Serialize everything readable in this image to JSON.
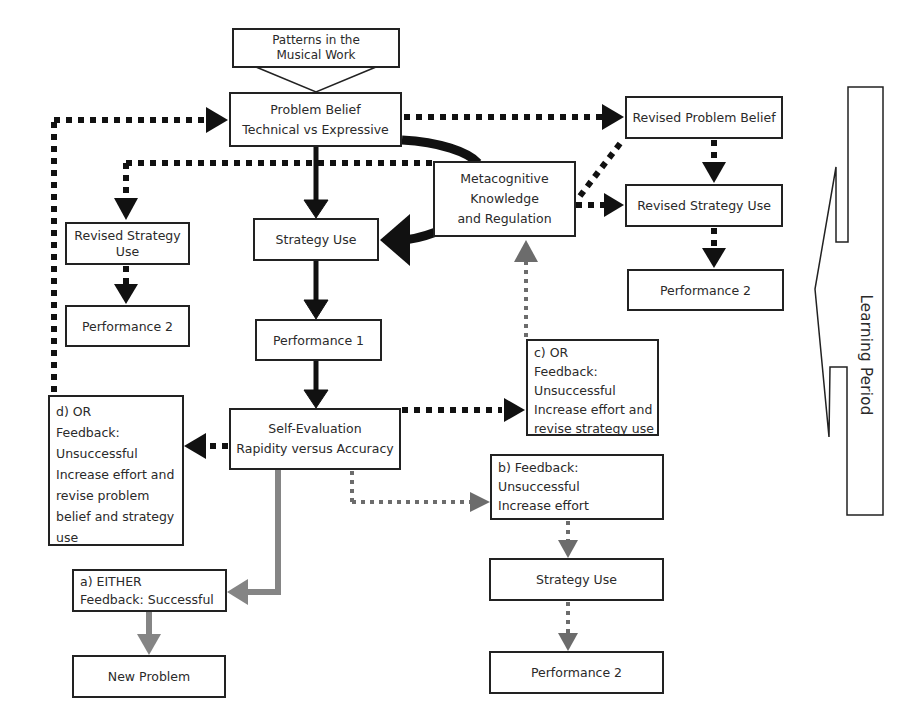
{
  "diagram": {
    "type": "flowchart",
    "nodes": {
      "patterns": {
        "lines": [
          "Patterns in the",
          "Musical Work"
        ]
      },
      "problem_belief": {
        "lines": [
          "Problem Belief",
          "Technical vs Expressive"
        ]
      },
      "metacognitive": {
        "lines": [
          "Metacognitive",
          "Knowledge",
          "and Regulation"
        ]
      },
      "revised_problem_belief": {
        "lines": [
          "Revised Problem Belief"
        ]
      },
      "revised_strategy_use_right": {
        "lines": [
          "Revised Strategy Use"
        ]
      },
      "performance2_right": {
        "lines": [
          "Performance 2"
        ]
      },
      "revised_strategy_use_left": {
        "lines": [
          "Revised Strategy",
          "Use"
        ]
      },
      "performance2_left": {
        "lines": [
          "Performance 2"
        ]
      },
      "strategy_use": {
        "lines": [
          "Strategy Use"
        ]
      },
      "performance1": {
        "lines": [
          "Performance 1"
        ]
      },
      "self_evaluation": {
        "lines": [
          "Self-Evaluation",
          "Rapidity versus Accuracy"
        ]
      },
      "feedback_d": {
        "lines": [
          "d) OR",
          "Feedback:",
          "Unsuccessful",
          "Increase effort and",
          "revise problem",
          "belief and strategy",
          "use"
        ]
      },
      "feedback_c": {
        "lines": [
          "c) OR",
          "Feedback:",
          "Unsuccessful",
          "Increase effort and",
          "revise strategy use"
        ]
      },
      "feedback_b": {
        "lines": [
          "b) Feedback:",
          "Unsuccessful",
          "Increase effort"
        ]
      },
      "feedback_a": {
        "lines": [
          "a) EITHER",
          "Feedback: Successful"
        ]
      },
      "new_problem": {
        "lines": [
          "New Problem"
        ]
      },
      "strategy_use_bottom": {
        "lines": [
          "Strategy Use"
        ]
      },
      "performance2_bottom": {
        "lines": [
          "Performance 2"
        ]
      }
    },
    "side_label": "Learning Period",
    "edges": [
      {
        "from": "patterns",
        "to": "problem_belief",
        "style": "open-block-arrow"
      },
      {
        "from": "problem_belief",
        "to": "strategy_use",
        "style": "solid-black"
      },
      {
        "from": "strategy_use",
        "to": "performance1",
        "style": "solid-black"
      },
      {
        "from": "performance1",
        "to": "self_evaluation",
        "style": "solid-black"
      },
      {
        "from": "problem_belief",
        "to": "strategy_use",
        "via": "metacognitive",
        "style": "thick-curved-black"
      },
      {
        "from": "problem_belief",
        "to": "revised_problem_belief",
        "style": "dotted-black"
      },
      {
        "from": "revised_problem_belief",
        "to": "revised_strategy_use_right",
        "style": "dotted-black"
      },
      {
        "from": "metacognitive",
        "to": "revised_strategy_use_right",
        "style": "dotted-black"
      },
      {
        "from": "metacognitive",
        "to": "revised_problem_belief",
        "style": "dotted-black"
      },
      {
        "from": "revised_strategy_use_right",
        "to": "performance2_right",
        "style": "dotted-black"
      },
      {
        "from": "metacognitive",
        "to": "revised_strategy_use_left",
        "style": "dotted-black"
      },
      {
        "from": "revised_strategy_use_left",
        "to": "performance2_left",
        "style": "dotted-black"
      },
      {
        "from": "feedback_d",
        "to": "problem_belief",
        "style": "dotted-black"
      },
      {
        "from": "self_evaluation",
        "to": "feedback_d",
        "style": "dotted-black"
      },
      {
        "from": "self_evaluation",
        "to": "feedback_c",
        "style": "dotted-black"
      },
      {
        "from": "feedback_c",
        "to": "metacognitive",
        "style": "dotted-gray"
      },
      {
        "from": "self_evaluation",
        "to": "feedback_b",
        "style": "dotted-gray"
      },
      {
        "from": "feedback_b",
        "to": "strategy_use_bottom",
        "style": "dotted-gray"
      },
      {
        "from": "strategy_use_bottom",
        "to": "performance2_bottom",
        "style": "dotted-gray"
      },
      {
        "from": "self_evaluation",
        "to": "feedback_a",
        "style": "solid-gray"
      },
      {
        "from": "feedback_a",
        "to": "new_problem",
        "style": "solid-gray"
      }
    ],
    "colors": {
      "black": "#111111",
      "gray": "#7a7a7a",
      "text": "#2a2a2a",
      "border": "#222222"
    }
  }
}
